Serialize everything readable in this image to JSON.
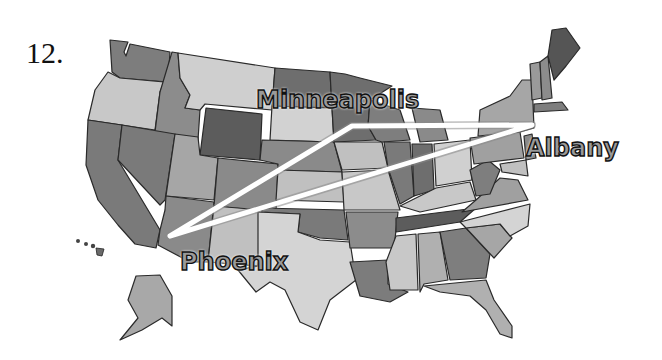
{
  "problem": {
    "number": "12."
  },
  "map": {
    "subject": "United States map (grayscale states)",
    "route_color": "#ffffff",
    "cities": [
      {
        "name": "Minneapolis",
        "x": 352,
        "y": 126
      },
      {
        "name": "Albany",
        "x": 532,
        "y": 125
      },
      {
        "name": "Phoenix",
        "x": 170,
        "y": 236
      }
    ],
    "routes": [
      {
        "from": "Phoenix",
        "to": "Minneapolis"
      },
      {
        "from": "Minneapolis",
        "to": "Albany"
      },
      {
        "from": "Albany",
        "to": "Phoenix"
      }
    ]
  }
}
